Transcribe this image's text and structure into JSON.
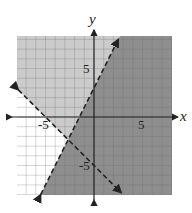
{
  "chart_data": {
    "type": "inequality_region",
    "title": "",
    "xlabel": "x",
    "ylabel": "y",
    "xlim": [
      -8,
      8
    ],
    "ylim": [
      -8,
      8
    ],
    "grid": true,
    "grid_step": 1,
    "x_tick_labels": [
      {
        "value": -5,
        "label": "-5"
      },
      {
        "value": 5,
        "label": "5"
      }
    ],
    "y_tick_labels": [
      {
        "value": 5,
        "label": "5"
      },
      {
        "value": -5,
        "label": "-5"
      }
    ],
    "lines": [
      {
        "name": "boundary-1",
        "equation": "y = 2x + 3",
        "slope": 2,
        "intercept": 3,
        "style": "dashed",
        "from": [
          -5.5,
          -8
        ],
        "to": [
          2.5,
          8
        ]
      },
      {
        "name": "boundary-2",
        "equation": "y = -x - 5",
        "slope": -1,
        "intercept": -5,
        "style": "dashed",
        "from": [
          -7.8,
          2.8
        ],
        "to": [
          2.8,
          -7.8
        ]
      }
    ],
    "regions": [
      {
        "name": "dark-region",
        "inequality": "y < 2x + 3",
        "color": "#8e8e8e"
      },
      {
        "name": "light-region",
        "inequality": "y > 2x + 3 and y > -x - 5",
        "color": "#cbcbcb"
      },
      {
        "name": "white-region",
        "inequality": "y > 2x + 3 and y < -x - 5",
        "color": "#ffffff"
      }
    ],
    "intersection": [
      -2.67,
      -2.33
    ]
  },
  "labels": {
    "x_axis": "x",
    "y_axis": "y",
    "x_pos5": "5",
    "x_neg5": "-5",
    "y_pos5": "5",
    "y_neg5": "-5"
  },
  "colors": {
    "dark": "#8e8e8e",
    "light": "#cbcbcb",
    "white": "#ffffff",
    "grid_light": "#a9a9a9",
    "grid_dark": "#7d7d7d",
    "axis": "#222222"
  }
}
